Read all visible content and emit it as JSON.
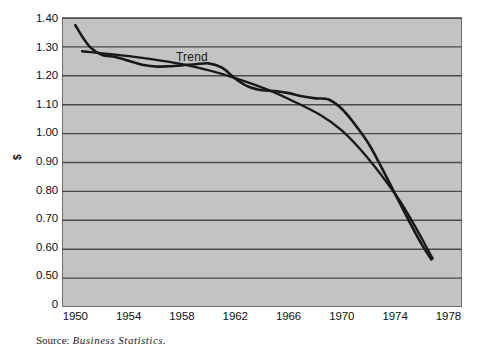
{
  "figure": {
    "plot_background": "#c3c3c3",
    "page_background": "#ffffff",
    "line_color": "#181818",
    "gridline_color": "#4a4a4a",
    "frame_color": "#6f6f6f"
  },
  "source": {
    "label": "Source:",
    "title": "Business Statistics."
  },
  "chart_data": {
    "type": "line",
    "title": "",
    "subtitle": "",
    "xlabel": "",
    "ylabel": "$",
    "grid": true,
    "grid_axis": "y",
    "legend": "none",
    "annotations": [
      {
        "text": "Trend",
        "x": 1959.3,
        "y": 1.277
      }
    ],
    "xlim": [
      1949,
      1979
    ],
    "ylim": [
      0,
      1.4
    ],
    "xticks": [
      1950,
      1954,
      1958,
      1962,
      1966,
      1970,
      1974,
      1978
    ],
    "xtick_labels": [
      "1950",
      "1954",
      "1958",
      "1962",
      "1966",
      "1970",
      "1974",
      "1978"
    ],
    "yticks": [
      0,
      0.5,
      0.6,
      0.7,
      0.8,
      0.9,
      1.0,
      1.1,
      1.2,
      1.3,
      1.4
    ],
    "ytick_labels": [
      "0",
      "0.50",
      "0.60",
      "0.70",
      "0.80",
      "0.90",
      "1.00",
      "1.10",
      "1.20",
      "1.30",
      "1.40"
    ],
    "series": [
      {
        "name": "Series",
        "label": "",
        "x": [
          1950.0,
          1950.6,
          1951.2,
          1952.0,
          1953.0,
          1954.0,
          1955.0,
          1956.0,
          1957.0,
          1958.0,
          1959.0,
          1960.0,
          1961.0,
          1962.0,
          1963.0,
          1964.0,
          1965.0,
          1966.0,
          1967.0,
          1968.0,
          1969.0,
          1970.0,
          1971.0,
          1972.0,
          1973.0,
          1974.0,
          1975.0,
          1976.0,
          1976.7
        ],
        "values": [
          1.375,
          1.33,
          1.295,
          1.272,
          1.265,
          1.252,
          1.238,
          1.232,
          1.233,
          1.236,
          1.24,
          1.243,
          1.228,
          1.19,
          1.162,
          1.15,
          1.147,
          1.14,
          1.129,
          1.122,
          1.118,
          1.085,
          1.03,
          0.965,
          0.88,
          0.79,
          0.7,
          0.615,
          0.565
        ]
      },
      {
        "name": "Trend",
        "label": "Trend",
        "x": [
          1950.5,
          1954.0,
          1958.0,
          1962.0,
          1966.0,
          1970.0,
          1974.0,
          1976.8
        ],
        "values": [
          1.285,
          1.268,
          1.24,
          1.192,
          1.12,
          1.01,
          0.79,
          0.568
        ]
      }
    ]
  }
}
